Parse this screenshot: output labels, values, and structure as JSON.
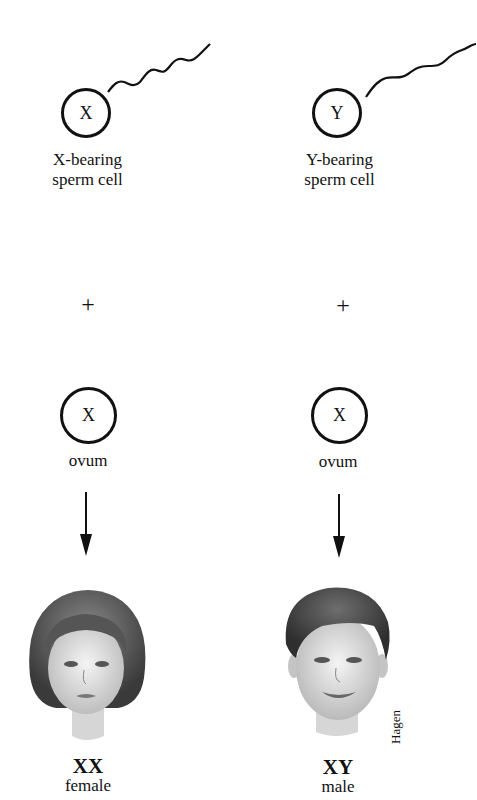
{
  "left_column": {
    "sperm": {
      "symbol": "X",
      "label_line1": "X-bearing",
      "label_line2": "sperm cell"
    },
    "operator": "+",
    "ovum": {
      "symbol": "X",
      "label": "ovum"
    },
    "result": {
      "genotype": "XX",
      "sex": "female"
    }
  },
  "right_column": {
    "sperm": {
      "symbol": "Y",
      "label_line1": "Y-bearing",
      "label_line2": "sperm cell"
    },
    "operator": "+",
    "ovum": {
      "symbol": "X",
      "label": "ovum"
    },
    "result": {
      "genotype": "XY",
      "sex": "male"
    }
  },
  "artist_signature": "Hagen"
}
